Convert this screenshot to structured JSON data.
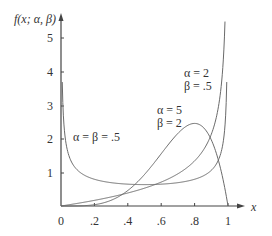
{
  "chart_data": {
    "type": "line",
    "title": "",
    "xlabel": "x",
    "ylabel": "f(x; α, β)",
    "xlim": [
      0,
      1
    ],
    "ylim": [
      0,
      5.5
    ],
    "grid": false,
    "x_ticks": [
      "0",
      ".2",
      ".4",
      ".6",
      ".8",
      "1"
    ],
    "y_ticks": [
      "1",
      "2",
      "3",
      "4",
      "5"
    ],
    "series": [
      {
        "name": "α = β = .5",
        "label_lines": [
          "α = β = .5"
        ],
        "x": [
          0.01,
          0.05,
          0.1,
          0.2,
          0.3,
          0.4,
          0.5,
          0.6,
          0.7,
          0.8,
          0.9,
          0.95,
          0.99
        ],
        "values": [
          3.2,
          1.46,
          1.06,
          0.8,
          0.69,
          0.65,
          0.64,
          0.65,
          0.69,
          0.8,
          1.06,
          1.46,
          3.2
        ]
      },
      {
        "name": "α = 2, β = .5",
        "label_lines": [
          "α = 2",
          "β = .5"
        ],
        "x": [
          0,
          0.1,
          0.2,
          0.3,
          0.4,
          0.5,
          0.6,
          0.7,
          0.8,
          0.9,
          0.95,
          0.98
        ],
        "values": [
          0,
          0.08,
          0.17,
          0.27,
          0.39,
          0.53,
          0.71,
          0.96,
          1.34,
          2.13,
          3.19,
          5.2
        ]
      },
      {
        "name": "α = 5, β = 2",
        "label_lines": [
          "α = 5",
          "β = 2"
        ],
        "x": [
          0,
          0.1,
          0.2,
          0.3,
          0.4,
          0.5,
          0.6,
          0.7,
          0.8,
          0.9,
          1.0
        ],
        "values": [
          0,
          0.003,
          0.038,
          0.17,
          0.46,
          0.94,
          1.56,
          2.16,
          2.46,
          1.97,
          0
        ]
      }
    ],
    "legend": "inline labels near curves"
  }
}
